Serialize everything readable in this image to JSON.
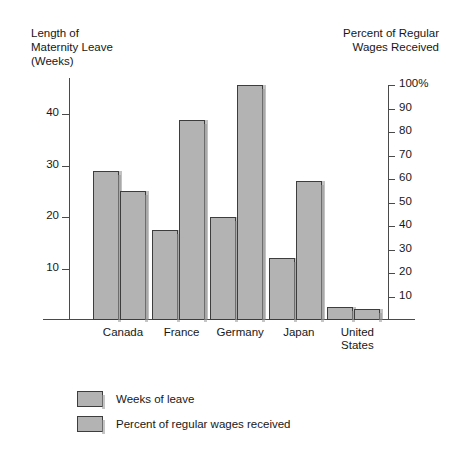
{
  "chart_data": {
    "type": "bar",
    "title": "",
    "categories": [
      "Canada",
      "France",
      "Germany",
      "Japan",
      "United\nStates"
    ],
    "series": [
      {
        "name": "Weeks of leave",
        "axis": "left",
        "values": [
          29,
          17.5,
          20,
          12,
          2.5
        ],
        "color": "#b3b3b3"
      },
      {
        "name": "Percent of regular wages received",
        "axis": "right",
        "values": [
          55,
          85,
          100,
          59,
          0
        ],
        "color": "#b3b3b3"
      }
    ],
    "left_axis": {
      "label": "Length of\nMaternity Leave\n(Weeks)",
      "ticks": [
        10,
        20,
        30,
        40
      ],
      "tick_labels": [
        "10",
        "20",
        "30",
        "40"
      ],
      "min": 0,
      "max": 47
    },
    "right_axis": {
      "label": "Percent of Regular\nWages Received",
      "ticks": [
        10,
        20,
        30,
        40,
        50,
        60,
        70,
        80,
        90,
        100
      ],
      "tick_labels": [
        "10",
        "20",
        "30",
        "40",
        "50",
        "60",
        "70",
        "80",
        "90",
        "100%"
      ],
      "min": 0,
      "max": 100
    },
    "xlabel": "",
    "grid": false,
    "legend_position": "bottom-left",
    "legend": [
      {
        "label": "Weeks of leave",
        "color": "#b3b3b3"
      },
      {
        "label": "Percent of regular wages received",
        "color": "#b3b3b3"
      }
    ]
  }
}
